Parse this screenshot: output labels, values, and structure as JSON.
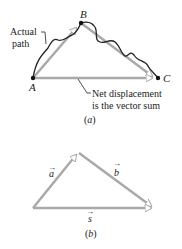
{
  "panel_a": {
    "point_a": "A",
    "point_b": "B",
    "point_c": "C",
    "actual_path_line1": "Actual",
    "actual_path_line2": "path",
    "net_line1": "Net displacement",
    "net_line2": "is the vector sum",
    "caption": "(a)"
  },
  "panel_b": {
    "vector_a": "a",
    "vector_b": "b",
    "vector_s": "s",
    "caption": "(b)"
  },
  "colors": {
    "vector": "#a9a9a9",
    "path": "#222222",
    "text": "#222222"
  }
}
